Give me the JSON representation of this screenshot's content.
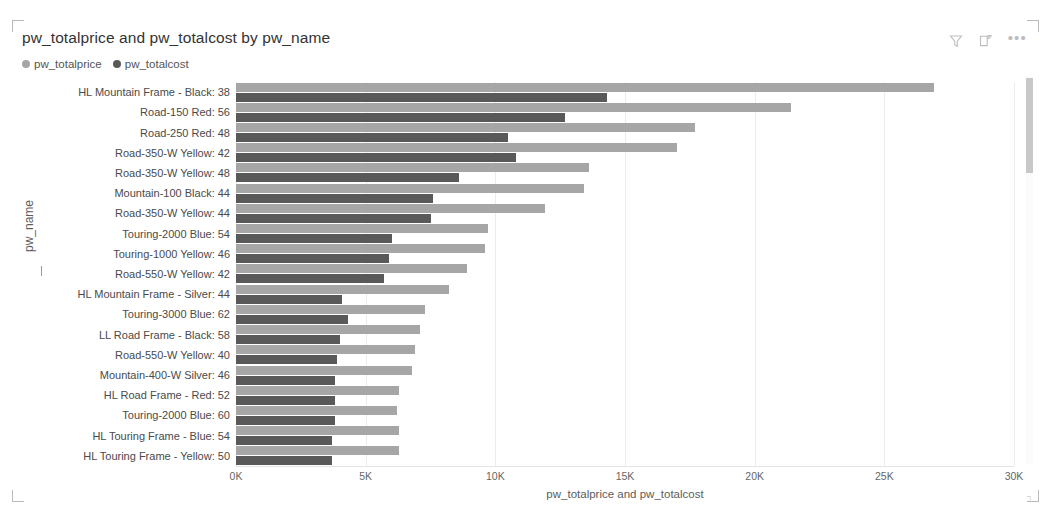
{
  "visual": {
    "title": "pw_totalprice and pw_totalcost by pw_name",
    "tools": {
      "filter_icon": "filter-icon",
      "focus_icon": "focus-mode-icon",
      "more_label": "•••"
    },
    "scrollbar": "vertical-scrollbar"
  },
  "colors": {
    "price": "#a6a6a6",
    "cost": "#595959",
    "grid": "#ececec",
    "text": "#4a4a4a"
  },
  "chart_data": {
    "type": "bar",
    "orientation": "horizontal",
    "title": "pw_totalprice and pw_totalcost by pw_name",
    "xlabel": "pw_totalprice and pw_totalcost",
    "ylabel": "pw_name",
    "xlim": [
      0,
      30000
    ],
    "xticks": [
      0,
      5000,
      10000,
      15000,
      20000,
      25000,
      30000
    ],
    "xticklabels": [
      "0K",
      "5K",
      "10K",
      "15K",
      "20K",
      "25K",
      "30K"
    ],
    "grid": true,
    "legend": [
      "pw_totalprice",
      "pw_totalcost"
    ],
    "legend_position": "top-left",
    "categories": [
      "HL Mountain Frame - Black: 38",
      "Road-150 Red: 56",
      "Road-250 Red: 48",
      "Road-350-W Yellow: 42",
      "Road-350-W Yellow: 48",
      "Mountain-100 Black: 44",
      "Road-350-W Yellow: 44",
      "Touring-2000 Blue: 54",
      "Touring-1000 Yellow: 46",
      "Road-550-W Yellow: 42",
      "HL Mountain Frame - Silver: 44",
      "Touring-3000 Blue: 62",
      "LL Road Frame - Black: 58",
      "Road-550-W Yellow: 40",
      "Mountain-400-W Silver: 46",
      "HL Road Frame - Red: 52",
      "Touring-2000 Blue: 60",
      "HL Touring Frame - Blue: 54",
      "HL Touring Frame - Yellow: 50"
    ],
    "series": [
      {
        "name": "pw_totalprice",
        "values": [
          26900,
          21400,
          17700,
          17000,
          13600,
          13400,
          11900,
          9700,
          9600,
          8900,
          8200,
          7300,
          7100,
          6900,
          6800,
          6300,
          6200,
          6300,
          6300
        ]
      },
      {
        "name": "pw_totalcost",
        "values": [
          14300,
          12700,
          10500,
          10800,
          8600,
          7600,
          7500,
          6000,
          5900,
          5700,
          4100,
          4300,
          4000,
          3900,
          3800,
          3800,
          3800,
          3700,
          3700
        ]
      }
    ]
  }
}
